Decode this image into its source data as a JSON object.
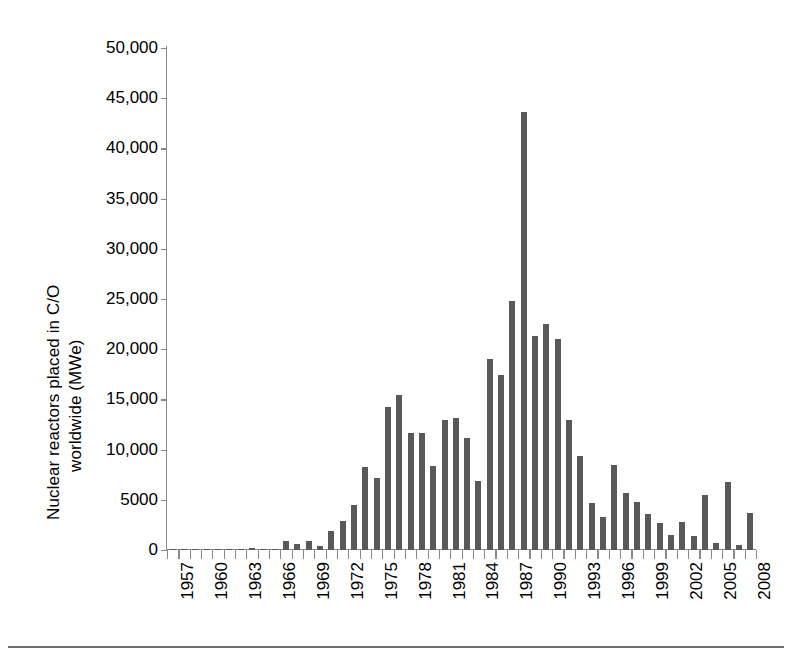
{
  "figure": {
    "caption_rule_present": true
  },
  "chart_data": {
    "type": "bar",
    "title": "",
    "xlabel": "",
    "ylabel": "Nuclear reactors placed in C/O worldwide (MWe)",
    "ylabel_lines": [
      "Nuclear reactors placed in C/O",
      "worldwide (MWe)"
    ],
    "ylim": [
      0,
      50000
    ],
    "ytick_values": [
      0,
      5000,
      10000,
      15000,
      20000,
      25000,
      30000,
      35000,
      40000,
      45000,
      50000
    ],
    "ytick_labels": [
      "0",
      "5000",
      "10,000",
      "15,000",
      "20,000",
      "25,000",
      "30,000",
      "35,000",
      "40,000",
      "45,000",
      "50,000"
    ],
    "grid": false,
    "legend": null,
    "bar_color": "#595959",
    "axis_color": "#8a8a8a",
    "xtick_labels_shown": [
      "1957",
      "1960",
      "1963",
      "1966",
      "1969",
      "1972",
      "1975",
      "1978",
      "1981",
      "1984",
      "1987",
      "1990",
      "1993",
      "1996",
      "1999",
      "2002",
      "2005",
      "2008"
    ],
    "xtick_label_interval": 3,
    "xtick_label_rotation": 90,
    "categories": [
      "1957",
      "1958",
      "1959",
      "1960",
      "1961",
      "1962",
      "1963",
      "1964",
      "1965",
      "1966",
      "1967",
      "1968",
      "1969",
      "1970",
      "1971",
      "1972",
      "1973",
      "1974",
      "1975",
      "1976",
      "1977",
      "1978",
      "1979",
      "1980",
      "1981",
      "1982",
      "1983",
      "1984",
      "1985",
      "1986",
      "1987",
      "1988",
      "1989",
      "1990",
      "1991",
      "1992",
      "1993",
      "1994",
      "1995",
      "1996",
      "1997",
      "1998",
      "1999",
      "2000",
      "2001",
      "2002",
      "2003",
      "2004",
      "2005",
      "2006",
      "2007",
      "2008"
    ],
    "values": [
      150,
      120,
      130,
      60,
      50,
      80,
      60,
      240,
      70,
      60,
      850,
      600,
      900,
      400,
      1900,
      2900,
      4500,
      8300,
      7200,
      14200,
      15400,
      11700,
      11700,
      8400,
      12900,
      13100,
      11200,
      6900,
      19000,
      17400,
      24800,
      43600,
      21300,
      22500,
      21000,
      12900,
      9400,
      4700,
      3300,
      8500,
      5700,
      4800,
      3600,
      2700,
      1500,
      2800,
      1400,
      5500,
      700,
      6800,
      500,
      3700
    ],
    "peak": {
      "year": "1985",
      "value": 43600
    }
  }
}
